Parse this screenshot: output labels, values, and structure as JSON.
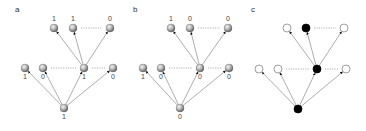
{
  "figure": {
    "width": 366,
    "height": 131,
    "colors": {
      "edge": "#8a8a8a",
      "arrowhead": "#111111",
      "dots": "#9a9a9a",
      "sphere_light": "#f2f2f2",
      "sphere_dark": "#6e6e6e",
      "filled": "#000000",
      "open_stroke": "#777777",
      "open_fill": "#ffffff"
    },
    "node_radius": 4
  },
  "panels": [
    {
      "id": "a",
      "label": "a",
      "label_pos": [
        15,
        12
      ],
      "style": "sphere",
      "root": {
        "x": 64,
        "y": 108,
        "value": "1"
      },
      "middle": [
        {
          "x": 25,
          "y": 68,
          "value": "1"
        },
        {
          "x": 43,
          "y": 68,
          "value": "0"
        },
        {
          "x": 84,
          "y": 68,
          "value": "1"
        },
        {
          "x": 113,
          "y": 68,
          "value": "0"
        }
      ],
      "hub_index": 2,
      "top": [
        {
          "x": 54,
          "y": 28,
          "value": "1"
        },
        {
          "x": 73,
          "y": 28,
          "value": "1"
        },
        {
          "x": 110,
          "y": 28,
          "value": "0"
        }
      ]
    },
    {
      "id": "b",
      "label": "b",
      "label_pos": [
        133,
        12
      ],
      "style": "sphere",
      "root": {
        "x": 180,
        "y": 108,
        "value": "0"
      },
      "middle": [
        {
          "x": 143,
          "y": 68,
          "value": "1"
        },
        {
          "x": 161,
          "y": 68,
          "value": "0"
        },
        {
          "x": 200,
          "y": 68,
          "value": "0"
        },
        {
          "x": 229,
          "y": 68,
          "value": "0"
        }
      ],
      "hub_index": 2,
      "top": [
        {
          "x": 171,
          "y": 28,
          "value": "1"
        },
        {
          "x": 190,
          "y": 28,
          "value": "0"
        },
        {
          "x": 228,
          "y": 28,
          "value": "0"
        }
      ]
    },
    {
      "id": "c",
      "label": "c",
      "label_pos": [
        251,
        12
      ],
      "style": "binary",
      "root": {
        "x": 298,
        "y": 109,
        "filled": true
      },
      "middle": [
        {
          "x": 259,
          "y": 69,
          "filled": false
        },
        {
          "x": 278,
          "y": 69,
          "filled": false
        },
        {
          "x": 317,
          "y": 69,
          "filled": true
        },
        {
          "x": 346,
          "y": 69,
          "filled": false
        }
      ],
      "hub_index": 2,
      "top": [
        {
          "x": 287,
          "y": 28,
          "filled": false
        },
        {
          "x": 306,
          "y": 28,
          "filled": true
        },
        {
          "x": 344,
          "y": 28,
          "filled": false
        }
      ]
    }
  ],
  "ellipsis_symbol": "......"
}
